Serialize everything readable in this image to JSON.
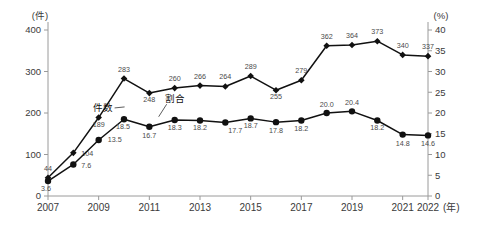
{
  "axes": {
    "left_unit": "(件)",
    "right_unit": "(%)",
    "x_unit": "(年)",
    "left_ticks": [
      "400",
      "300",
      "200",
      "100",
      "0"
    ],
    "right_ticks": [
      "40",
      "35",
      "30",
      "25",
      "20",
      "15",
      "10",
      "5",
      "0"
    ],
    "x_ticks": [
      "2007",
      "2009",
      "2011",
      "2013",
      "2015",
      "2017",
      "2019",
      "2021",
      "2022"
    ]
  },
  "legend": {
    "cases": "件数",
    "ratio": "割合"
  },
  "chart_data": {
    "type": "line",
    "title": "",
    "xlabel": "(年)",
    "ylabel": "(件)",
    "y2label": "(%)",
    "ylim": [
      0,
      400
    ],
    "y2lim": [
      0,
      40
    ],
    "grid": false,
    "legend_position": "inline-annotation",
    "x": [
      2007,
      2008,
      2009,
      2010,
      2011,
      2012,
      2013,
      2014,
      2015,
      2016,
      2017,
      2018,
      2019,
      2020,
      2021,
      2022
    ],
    "series": [
      {
        "name": "件数",
        "axis": "left",
        "marker": "diamond",
        "color": "#111111",
        "values": [
          44,
          104,
          189,
          283,
          248,
          260,
          266,
          264,
          289,
          255,
          279,
          362,
          364,
          373,
          340,
          337
        ],
        "labels": [
          "44",
          "104",
          "189",
          "283",
          "248",
          "260",
          "266",
          "264",
          "289",
          "255",
          "279",
          "362",
          "364",
          "373",
          "340",
          "337"
        ]
      },
      {
        "name": "割合",
        "axis": "right",
        "marker": "circle",
        "color": "#111111",
        "values": [
          3.6,
          7.6,
          13.5,
          18.5,
          16.7,
          18.3,
          18.2,
          17.7,
          18.7,
          17.8,
          18.2,
          20.0,
          20.4,
          18.2,
          14.8,
          14.6
        ],
        "labels": [
          "3.6",
          "7.6",
          "13.5",
          "18.5",
          "16.7",
          "18.3",
          "18.2",
          "17.7",
          "18.7",
          "17.8",
          "18.2",
          "20.0",
          "20.4",
          "18.2",
          "14.8",
          "14.6"
        ]
      }
    ]
  }
}
